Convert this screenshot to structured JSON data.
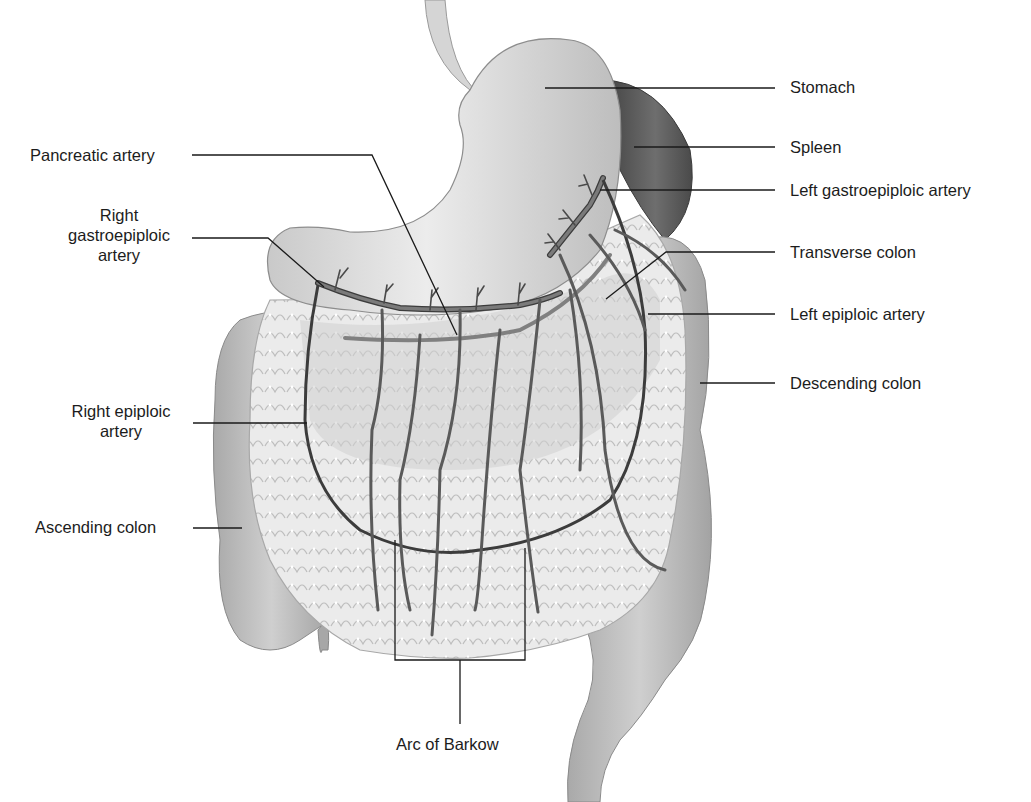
{
  "diagram": {
    "colors": {
      "background": "#ffffff",
      "organ_fill": "#d9d9d9",
      "organ_light": "#ebebeb",
      "organ_dark": "#9a9a9a",
      "spleen": "#5e5e5e",
      "omentum": "#e6e6e6",
      "artery": "#6f6f6f",
      "artery_outline": "#3c3c3c",
      "leader_line": "#1a1a1a"
    },
    "labels": {
      "stomach": "Stomach",
      "spleen": "Spleen",
      "pancreatic_artery": "Pancreatic artery",
      "left_gastroepiploic_artery": "Left gastroepiploic artery",
      "right_gastroepiploic_artery_line1": "Right",
      "right_gastroepiploic_artery_line2": "gastroepiploic",
      "right_gastroepiploic_artery_line3": "artery",
      "transverse_colon": "Transverse colon",
      "left_epiploic_artery": "Left epiploic artery",
      "descending_colon": "Descending colon",
      "right_epiploic_artery_line1": "Right epiploic",
      "right_epiploic_artery_line2": "artery",
      "ascending_colon": "Ascending colon",
      "arc_of_barkow": "Arc of Barkow"
    }
  }
}
